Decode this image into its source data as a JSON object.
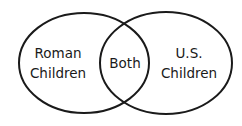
{
  "diagram": {
    "type": "venn",
    "sets": [
      {
        "id": "left",
        "label_lines": [
          "Roman",
          "Children"
        ]
      },
      {
        "id": "right",
        "label_lines": [
          "U.S.",
          "Children"
        ]
      }
    ],
    "intersection": {
      "label": "Both"
    },
    "colors": {
      "stroke": "#1a1a1a",
      "fill": "#ffffff",
      "text": "#1a1a1a"
    }
  }
}
